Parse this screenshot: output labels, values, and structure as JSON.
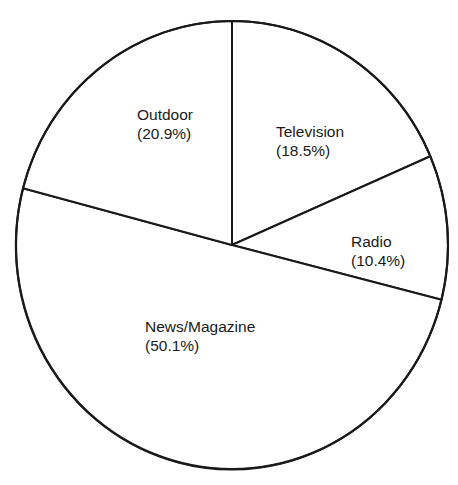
{
  "chart_data": {
    "type": "pie",
    "title": "",
    "categories": [
      "Television",
      "Radio",
      "News/Magazine",
      "Outdoor"
    ],
    "values": [
      18.5,
      10.4,
      50.1,
      20.9
    ],
    "unit": "%",
    "start_angle_deg": -90,
    "direction": "clockwise",
    "legend": "none (inline labels)",
    "labels": [
      {
        "name": "Television",
        "pct": "(18.5%)"
      },
      {
        "name": "Radio",
        "pct": "(10.4%)"
      },
      {
        "name": "News/Magazine",
        "pct": "(50.1%)"
      },
      {
        "name": "Outdoor",
        "pct": "(20.9%)"
      }
    ]
  },
  "colors": {
    "fill": "#ffffff",
    "stroke": "#1a1a1a",
    "text": "#1a1a1a"
  }
}
